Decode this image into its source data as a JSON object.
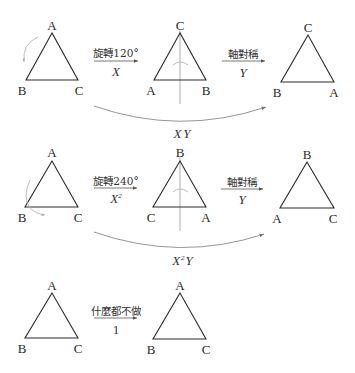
{
  "rows": [
    {
      "name": "rotate-120-then-reflect",
      "start_triangle": {
        "top": "A",
        "left": "B",
        "right": "C"
      },
      "step1": {
        "label": "旋轉120°",
        "symbol": "X"
      },
      "middle_triangle": {
        "top": "C",
        "left": "A",
        "right": "B"
      },
      "step2": {
        "label": "軸對稱",
        "symbol": "Y"
      },
      "end_triangle": {
        "top": "C",
        "left": "B",
        "right": "A"
      },
      "composite": {
        "symbol_base": "X",
        "symbol_exp": "",
        "symbol_tail": "Y"
      }
    },
    {
      "name": "rotate-240-then-reflect",
      "start_triangle": {
        "top": "A",
        "left": "B",
        "right": "C"
      },
      "step1": {
        "label": "旋轉240°",
        "symbol_base": "X",
        "symbol_exp": "2"
      },
      "middle_triangle": {
        "top": "B",
        "left": "C",
        "right": "A"
      },
      "step2": {
        "label": "軸對稱",
        "symbol": "Y"
      },
      "end_triangle": {
        "top": "B",
        "left": "A",
        "right": "C"
      },
      "composite": {
        "symbol_base": "X",
        "symbol_exp": "2",
        "symbol_tail": "Y"
      }
    },
    {
      "name": "identity",
      "start_triangle": {
        "top": "A",
        "left": "B",
        "right": "C"
      },
      "step1": {
        "label": "什麼都不做",
        "symbol": "1"
      },
      "end_triangle": {
        "top": "A",
        "left": "B",
        "right": "C"
      }
    }
  ],
  "colors": {
    "triangle": "#2a2a2a",
    "axis": "#9a9a9a",
    "curve": "#8a8a8a"
  }
}
